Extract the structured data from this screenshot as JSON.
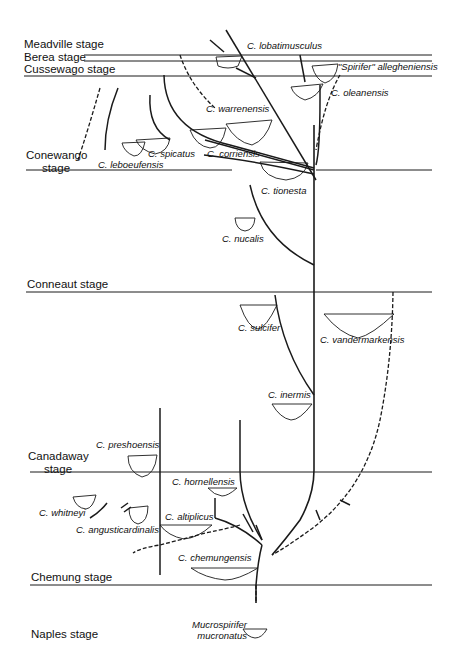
{
  "stages": [
    {
      "id": "meadville",
      "label": "Meadville stage",
      "y": 44
    },
    {
      "id": "berea",
      "label": "Berea stage",
      "y": 59
    },
    {
      "id": "cussewago",
      "label": "Cussewago stage",
      "y": 71
    },
    {
      "id": "conewango",
      "label_line1": "Conewango",
      "label_line2": "stage",
      "y": 150
    },
    {
      "id": "conneaut",
      "label": "Conneaut stage",
      "y": 285
    },
    {
      "id": "canadaway",
      "label_line1": "Canadaway",
      "label_line2": "stage",
      "y": 455
    },
    {
      "id": "chemung",
      "label": "Chemung stage",
      "y": 578
    },
    {
      "id": "naples",
      "label": "Naples stage",
      "y": 634
    }
  ],
  "species": {
    "lobatimusculus": "C. lobatimusculus",
    "allegheniensis": "\"Spirifer\" allegheniensis",
    "oleanensis": "C. oleanensis",
    "warrenensis": "C. warrenensis",
    "spicatus": "C. spicatus",
    "corriensis": "C. corriensis",
    "leboeufensis": "C. leboeufensis",
    "tionesta": "C. tionesta",
    "nucalis": "C. nucalis",
    "sulcifer": "C. sulcifer",
    "vandermarkensis": "C. vandermarkensis",
    "inermis": "C. inermis",
    "preshoensis": "C. preshoensis",
    "hornellensis": "C. hornellensis",
    "whitneyi": "C. whitneyi",
    "altiplicus": "C. altiplicus",
    "angusticardinalis": "C. angusticardinalis",
    "chemungensis": "C. chemungensis",
    "mucronatus_line1": "Mucrospirifer",
    "mucronatus_line2": "mucronatus"
  },
  "colors": {
    "line": "#1a1a1a",
    "background": "#ffffff"
  }
}
